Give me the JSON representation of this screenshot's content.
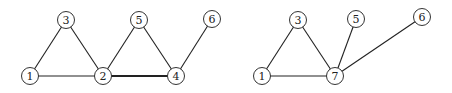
{
  "graphs": [
    {
      "id": "left",
      "nodes": [
        {
          "label": "1",
          "x": 30,
          "y": 76
        },
        {
          "label": "3",
          "x": 66,
          "y": 20
        },
        {
          "label": "2",
          "x": 103,
          "y": 76
        },
        {
          "label": "5",
          "x": 139,
          "y": 20
        },
        {
          "label": "4",
          "x": 176,
          "y": 76
        },
        {
          "label": "6",
          "x": 212,
          "y": 19
        }
      ],
      "edges": [
        {
          "from": "1",
          "to": "3",
          "bold": false
        },
        {
          "from": "3",
          "to": "2",
          "bold": false
        },
        {
          "from": "1",
          "to": "2",
          "bold": false
        },
        {
          "from": "2",
          "to": "5",
          "bold": false
        },
        {
          "from": "5",
          "to": "4",
          "bold": false
        },
        {
          "from": "2",
          "to": "4",
          "bold": true
        },
        {
          "from": "4",
          "to": "6",
          "bold": false
        }
      ]
    },
    {
      "id": "right",
      "nodes": [
        {
          "label": "1",
          "x": 262,
          "y": 76
        },
        {
          "label": "3",
          "x": 298,
          "y": 20
        },
        {
          "label": "5",
          "x": 356,
          "y": 19
        },
        {
          "label": "6",
          "x": 422,
          "y": 17
        },
        {
          "label": "7",
          "x": 335,
          "y": 76
        }
      ],
      "edges": [
        {
          "from": "1",
          "to": "3",
          "bold": false
        },
        {
          "from": "3",
          "to": "7",
          "bold": false
        },
        {
          "from": "1",
          "to": "7",
          "bold": false
        },
        {
          "from": "7",
          "to": "5",
          "bold": false
        },
        {
          "from": "7",
          "to": "6",
          "bold": false
        }
      ]
    }
  ],
  "node_radius": 8.5
}
